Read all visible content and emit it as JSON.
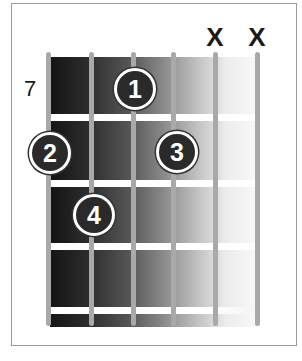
{
  "diagram": {
    "type": "guitar-chord-diagram",
    "start_fret": "7",
    "strings_count": 6,
    "frets_shown": 4,
    "muted_strings": [
      {
        "string": 5,
        "symbol": "X"
      },
      {
        "string": 6,
        "symbol": "X"
      }
    ],
    "fingers": [
      {
        "label": "1",
        "string": 3,
        "fret": 1
      },
      {
        "label": "2",
        "string": 1,
        "fret": 2
      },
      {
        "label": "3",
        "string": 4,
        "fret": 2
      },
      {
        "label": "4",
        "string": 2,
        "fret": 3
      }
    ],
    "colors": {
      "board_dark": "#141414",
      "board_light": "#f8f8f8",
      "string": "#a9a9a9",
      "fret": "#ffffff",
      "finger_dot": "#2a2a2a",
      "finger_text": "#ffffff",
      "frame": "#9a9a9a"
    }
  }
}
